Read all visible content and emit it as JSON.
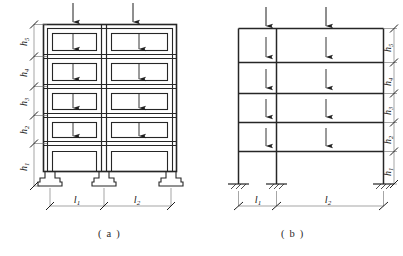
{
  "figure": {
    "panels": [
      {
        "id": "a",
        "caption": "( a )",
        "description": "building-elevation-with-footings",
        "support_type": "stepped-spread-footing",
        "wall_style": "double-line-masonry",
        "storeys": 5
      },
      {
        "id": "b",
        "caption": "( b )",
        "description": "equivalent-single-line-frame",
        "support_type": "fixed-hatched",
        "wall_style": "single-line",
        "storeys": 5
      }
    ]
  },
  "dimensions": {
    "storey_heights": [
      {
        "key": "h5",
        "label": "h",
        "sub": "5",
        "order_from_top": 1
      },
      {
        "key": "h4",
        "label": "h",
        "sub": "4",
        "order_from_top": 2
      },
      {
        "key": "h3",
        "label": "h",
        "sub": "3",
        "order_from_top": 3
      },
      {
        "key": "h2",
        "label": "h",
        "sub": "2",
        "order_from_top": 4
      },
      {
        "key": "h1",
        "label": "h",
        "sub": "1",
        "order_from_top": 5
      }
    ],
    "bay_spans": [
      {
        "key": "l1",
        "label": "l",
        "sub": "1",
        "position": "left-bay"
      },
      {
        "key": "l2",
        "label": "l",
        "sub": "2",
        "position": "right-bay"
      }
    ]
  },
  "loads": {
    "symbol": "downward-arrow",
    "roof_arrow_count": 2,
    "floor_arrow_count_per_storey": 2,
    "loaded_storeys": 4,
    "note": "uniform gravity load applied at each floor of each bay"
  },
  "colors": {
    "background": "#ffffff",
    "structure_line": "#262626",
    "thin_line": "#555555",
    "dimension_line": "#6a6a6a",
    "text": "#1a1a1a"
  }
}
